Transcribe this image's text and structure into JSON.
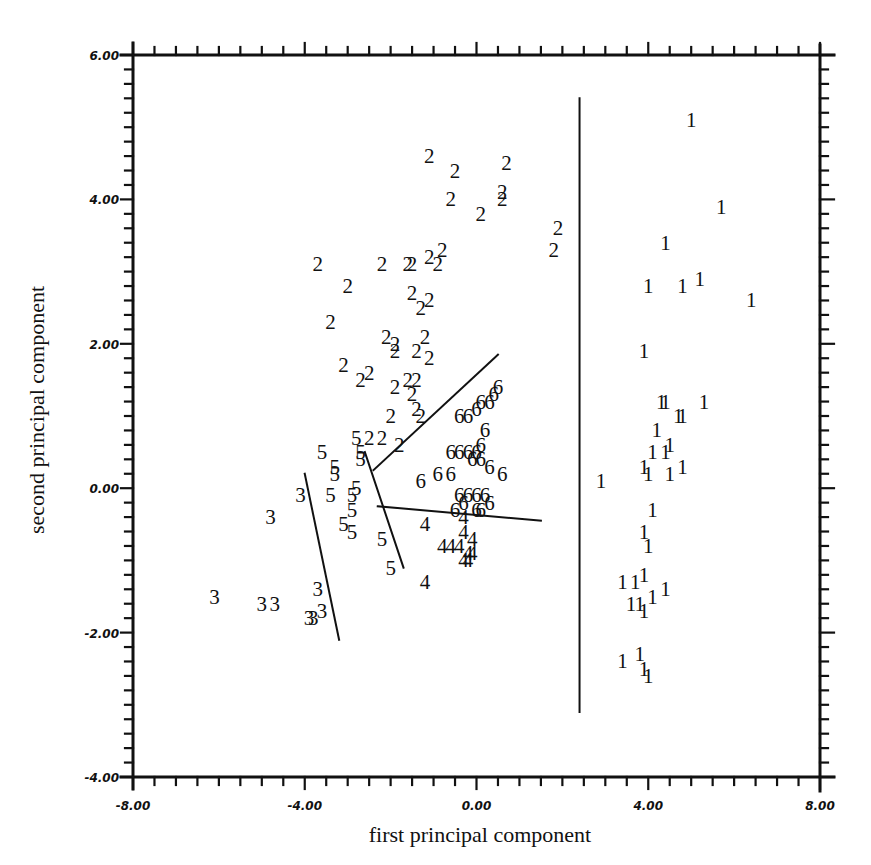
{
  "chart_data": {
    "type": "scatter",
    "title": "",
    "xlabel": "first principal component",
    "ylabel": "second principal component",
    "xlim": [
      -8,
      8
    ],
    "ylim": [
      -4,
      6
    ],
    "x_ticks": [
      "-8.00",
      "-4.00",
      "0.00",
      "4.00",
      "8.00"
    ],
    "y_ticks": [
      "6.00",
      "4.00",
      "2.00",
      "0.00",
      "-2.00",
      "-4.00"
    ],
    "grid": false,
    "legend": "none (points plotted as class-number glyphs 1-6)",
    "series": [
      {
        "name": "1",
        "points": [
          [
            5.0,
            5.1
          ],
          [
            5.7,
            3.9
          ],
          [
            4.4,
            3.4
          ],
          [
            4.0,
            2.8
          ],
          [
            4.8,
            2.8
          ],
          [
            5.2,
            2.9
          ],
          [
            6.4,
            2.6
          ],
          [
            3.9,
            1.9
          ],
          [
            4.3,
            1.2
          ],
          [
            4.4,
            1.2
          ],
          [
            5.3,
            1.2
          ],
          [
            4.7,
            1.0
          ],
          [
            4.8,
            1.0
          ],
          [
            4.2,
            0.8
          ],
          [
            4.5,
            0.6
          ],
          [
            4.1,
            0.5
          ],
          [
            4.4,
            0.5
          ],
          [
            3.9,
            0.3
          ],
          [
            4.0,
            0.2
          ],
          [
            4.5,
            0.2
          ],
          [
            4.8,
            0.3
          ],
          [
            2.9,
            0.1
          ],
          [
            4.1,
            -0.3
          ],
          [
            3.9,
            -0.6
          ],
          [
            4.0,
            -0.8
          ],
          [
            3.4,
            -1.3
          ],
          [
            3.7,
            -1.3
          ],
          [
            3.9,
            -1.2
          ],
          [
            3.6,
            -1.6
          ],
          [
            3.8,
            -1.6
          ],
          [
            3.9,
            -1.7
          ],
          [
            4.1,
            -1.5
          ],
          [
            4.4,
            -1.4
          ],
          [
            3.4,
            -2.4
          ],
          [
            3.8,
            -2.3
          ],
          [
            3.9,
            -2.5
          ],
          [
            4.0,
            -2.6
          ]
        ]
      },
      {
        "name": "2",
        "points": [
          [
            -1.1,
            4.6
          ],
          [
            -0.5,
            4.4
          ],
          [
            0.7,
            4.5
          ],
          [
            -0.6,
            4.0
          ],
          [
            0.6,
            4.1
          ],
          [
            0.6,
            4.0
          ],
          [
            0.1,
            3.8
          ],
          [
            1.9,
            3.6
          ],
          [
            1.8,
            3.3
          ],
          [
            -3.7,
            3.1
          ],
          [
            -2.2,
            3.1
          ],
          [
            -1.6,
            3.1
          ],
          [
            -1.5,
            3.1
          ],
          [
            -1.1,
            3.2
          ],
          [
            -0.8,
            3.3
          ],
          [
            -0.9,
            3.1
          ],
          [
            -3.0,
            2.8
          ],
          [
            -1.5,
            2.7
          ],
          [
            -1.1,
            2.6
          ],
          [
            -1.3,
            2.5
          ],
          [
            -3.4,
            2.3
          ],
          [
            -2.1,
            2.1
          ],
          [
            -1.9,
            2.0
          ],
          [
            -1.2,
            2.1
          ],
          [
            -1.9,
            1.9
          ],
          [
            -1.4,
            1.9
          ],
          [
            -1.1,
            1.8
          ],
          [
            -3.1,
            1.7
          ],
          [
            -2.5,
            1.6
          ],
          [
            -2.7,
            1.5
          ],
          [
            -1.6,
            1.5
          ],
          [
            -1.4,
            1.5
          ],
          [
            -1.9,
            1.4
          ],
          [
            -1.5,
            1.3
          ],
          [
            -1.4,
            1.1
          ],
          [
            -1.3,
            1.0
          ],
          [
            -2.0,
            1.0
          ],
          [
            -2.5,
            0.7
          ],
          [
            -2.2,
            0.7
          ],
          [
            -1.8,
            0.6
          ]
        ]
      },
      {
        "name": "3",
        "points": [
          [
            -4.1,
            -0.1
          ],
          [
            -4.8,
            -0.4
          ],
          [
            -6.1,
            -1.5
          ],
          [
            -5.0,
            -1.6
          ],
          [
            -4.7,
            -1.6
          ],
          [
            -3.7,
            -1.4
          ],
          [
            -3.6,
            -1.7
          ],
          [
            -3.8,
            -1.8
          ],
          [
            -3.9,
            -1.8
          ]
        ]
      },
      {
        "name": "5",
        "points": [
          [
            -2.8,
            0.7
          ],
          [
            -3.6,
            0.5
          ],
          [
            -3.3,
            0.3
          ],
          [
            -3.3,
            0.2
          ],
          [
            -2.7,
            0.5
          ],
          [
            -2.7,
            0.4
          ],
          [
            -2.9,
            -0.1
          ],
          [
            -3.4,
            -0.1
          ],
          [
            -2.9,
            -0.3
          ],
          [
            -3.1,
            -0.5
          ],
          [
            -2.9,
            -0.6
          ],
          [
            -2.2,
            -0.7
          ],
          [
            -2.0,
            -1.1
          ],
          [
            -2.8,
            0.0
          ]
        ]
      },
      {
        "name": "6",
        "points": [
          [
            0.5,
            1.4
          ],
          [
            0.4,
            1.3
          ],
          [
            0.1,
            1.2
          ],
          [
            0.3,
            1.2
          ],
          [
            0.0,
            1.1
          ],
          [
            -0.4,
            1.0
          ],
          [
            -0.2,
            1.0
          ],
          [
            0.2,
            0.8
          ],
          [
            0.1,
            0.6
          ],
          [
            0.0,
            0.5
          ],
          [
            -0.6,
            0.5
          ],
          [
            -0.4,
            0.5
          ],
          [
            -0.2,
            0.5
          ],
          [
            -0.1,
            0.4
          ],
          [
            0.1,
            0.4
          ],
          [
            0.3,
            0.3
          ],
          [
            0.6,
            0.2
          ],
          [
            -1.3,
            0.1
          ],
          [
            -0.9,
            0.2
          ],
          [
            -0.6,
            0.2
          ],
          [
            -0.4,
            -0.1
          ],
          [
            -0.2,
            -0.1
          ],
          [
            0.0,
            -0.1
          ],
          [
            0.2,
            -0.1
          ],
          [
            -0.5,
            -0.3
          ],
          [
            -0.3,
            -0.2
          ],
          [
            0.0,
            -0.3
          ],
          [
            0.3,
            -0.2
          ],
          [
            0.1,
            -0.3
          ]
        ]
      },
      {
        "name": "4",
        "points": [
          [
            -1.2,
            -0.5
          ],
          [
            -0.3,
            -0.4
          ],
          [
            -0.3,
            -0.6
          ],
          [
            -0.8,
            -0.8
          ],
          [
            -0.6,
            -0.8
          ],
          [
            -0.4,
            -0.8
          ],
          [
            -0.2,
            -0.9
          ],
          [
            -0.1,
            -0.7
          ],
          [
            -0.3,
            -1.0
          ],
          [
            -0.2,
            -1.0
          ],
          [
            -0.1,
            -0.9
          ],
          [
            -1.2,
            -1.3
          ]
        ]
      }
    ],
    "annotations": {
      "lines": [
        {
          "from": [
            2.4,
            5.4
          ],
          "to": [
            2.4,
            -3.1
          ],
          "desc": "vertical separator between class 1 and others"
        },
        {
          "from": [
            -4.0,
            0.2
          ],
          "to": [
            -3.2,
            -2.1
          ],
          "desc": "line near class 3"
        },
        {
          "from": [
            -2.6,
            0.5
          ],
          "to": [
            -1.7,
            -1.1
          ],
          "desc": "line between class 5 and class 4/6"
        },
        {
          "from": [
            -2.3,
            -0.25
          ],
          "to": [
            1.5,
            -0.45
          ],
          "desc": "line between class 6 and class 4"
        },
        {
          "from": [
            -2.4,
            0.25
          ],
          "to": [
            0.5,
            1.85
          ],
          "desc": "line between class 2 and class 6"
        }
      ]
    }
  }
}
